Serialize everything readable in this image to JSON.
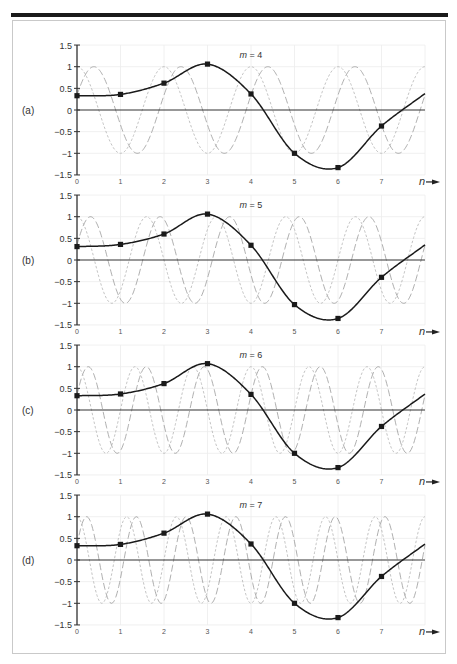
{
  "figure": {
    "panels": [
      {
        "label": "(a)",
        "m_label": "m = 4",
        "m": 4
      },
      {
        "label": "(b)",
        "m_label": "m = 5",
        "m": 5
      },
      {
        "label": "(c)",
        "m_label": "m = 6",
        "m": 6
      },
      {
        "label": "(d)",
        "m_label": "m = 7",
        "m": 7
      }
    ],
    "y_ticks": [
      "1.5",
      "1",
      "0.5",
      "0",
      "−0.5",
      "−1",
      "−1.5"
    ],
    "x_ticks": [
      "0",
      "1",
      "2",
      "3",
      "4",
      "5",
      "6",
      "7"
    ],
    "x_axis_label": "n",
    "colors": {
      "signal": "#1a1a1a",
      "dashed_component": "#9a9a9a",
      "dotted_component": "#b4b4b4",
      "grid": "#ececec",
      "axis": "#333333"
    }
  },
  "chart_data": [
    {
      "type": "line",
      "title": "(a) m = 4",
      "xlabel": "n",
      "ylabel": "",
      "xlim": [
        0,
        8
      ],
      "ylim": [
        -1.5,
        1.5
      ],
      "x_ticks": [
        0,
        1,
        2,
        3,
        4,
        5,
        6,
        7
      ],
      "y_ticks": [
        1.5,
        1,
        0.5,
        0,
        -0.5,
        -1,
        -1.5
      ],
      "grid": true,
      "series": [
        {
          "name": "signal samples",
          "style": "solid with square markers",
          "x": [
            0,
            1,
            2,
            3,
            4,
            5,
            6,
            7
          ],
          "values": [
            0.33,
            0.36,
            0.62,
            1.06,
            0.37,
            -1.0,
            -1.33,
            -0.37
          ]
        },
        {
          "name": "basis component (dashed)",
          "style": "long dash grey",
          "cycles_over_0_8": 4,
          "amplitude": 1
        },
        {
          "name": "basis component (dotted)",
          "style": "short dash light grey",
          "cycles_over_0_8": 4,
          "amplitude": 1
        }
      ]
    },
    {
      "type": "line",
      "title": "(b) m = 5",
      "xlabel": "n",
      "ylabel": "",
      "xlim": [
        0,
        8
      ],
      "ylim": [
        -1.5,
        1.5
      ],
      "x_ticks": [
        0,
        1,
        2,
        3,
        4,
        5,
        6,
        7
      ],
      "y_ticks": [
        1.5,
        1,
        0.5,
        0,
        -0.5,
        -1,
        -1.5
      ],
      "grid": true,
      "series": [
        {
          "name": "signal samples",
          "style": "solid with square markers",
          "x": [
            0,
            1,
            2,
            3,
            4,
            5,
            6,
            7
          ],
          "values": [
            0.31,
            0.36,
            0.6,
            1.06,
            0.34,
            -1.03,
            -1.35,
            -0.4
          ]
        },
        {
          "name": "basis component (dashed)",
          "style": "long dash grey",
          "cycles_over_0_8": 5,
          "amplitude": 1
        },
        {
          "name": "basis component (dotted)",
          "style": "short dash light grey",
          "cycles_over_0_8": 5,
          "amplitude": 1
        }
      ]
    },
    {
      "type": "line",
      "title": "(c) m = 6",
      "xlabel": "n",
      "ylabel": "",
      "xlim": [
        0,
        8
      ],
      "ylim": [
        -1.5,
        1.5
      ],
      "x_ticks": [
        0,
        1,
        2,
        3,
        4,
        5,
        6,
        7
      ],
      "y_ticks": [
        1.5,
        1,
        0.5,
        0,
        -0.5,
        -1,
        -1.5
      ],
      "grid": true,
      "series": [
        {
          "name": "signal samples",
          "style": "solid with square markers",
          "x": [
            0,
            1,
            2,
            3,
            4,
            5,
            6,
            7
          ],
          "values": [
            0.33,
            0.37,
            0.61,
            1.07,
            0.36,
            -1.0,
            -1.33,
            -0.38
          ]
        },
        {
          "name": "basis component (dashed)",
          "style": "long dash grey",
          "cycles_over_0_8": 6,
          "amplitude": 1
        },
        {
          "name": "basis component (dotted)",
          "style": "short dash light grey",
          "cycles_over_0_8": 6,
          "amplitude": 1
        }
      ]
    },
    {
      "type": "line",
      "title": "(d) m = 7",
      "xlabel": "n",
      "ylabel": "",
      "xlim": [
        0,
        8
      ],
      "ylim": [
        -1.5,
        1.5
      ],
      "x_ticks": [
        0,
        1,
        2,
        3,
        4,
        5,
        6,
        7
      ],
      "y_ticks": [
        1.5,
        1,
        0.5,
        0,
        -0.5,
        -1,
        -1.5
      ],
      "grid": true,
      "series": [
        {
          "name": "signal samples",
          "style": "solid with square markers",
          "x": [
            0,
            1,
            2,
            3,
            4,
            5,
            6,
            7
          ],
          "values": [
            0.33,
            0.36,
            0.62,
            1.06,
            0.37,
            -1.0,
            -1.33,
            -0.38
          ]
        },
        {
          "name": "basis component (dashed)",
          "style": "long dash grey",
          "cycles_over_0_8": 7,
          "amplitude": 1
        },
        {
          "name": "basis component (dotted)",
          "style": "short dash light grey",
          "cycles_over_0_8": 7,
          "amplitude": 1
        }
      ]
    }
  ]
}
